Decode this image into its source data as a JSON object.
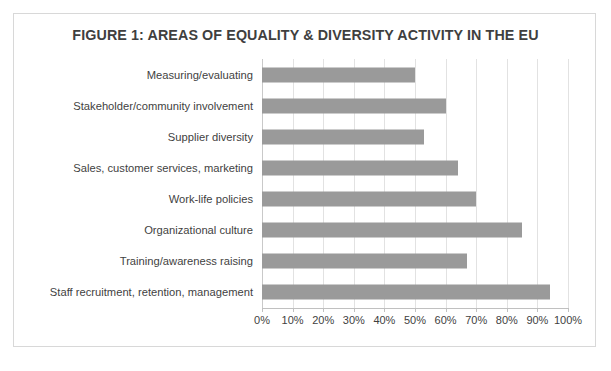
{
  "figure": {
    "title": "FIGURE 1: AREAS OF EQUALITY & DIVERSITY ACTIVITY IN THE EU"
  },
  "chart_data": {
    "type": "bar",
    "orientation": "horizontal",
    "title": "FIGURE 1: AREAS OF EQUALITY & DIVERSITY ACTIVITY IN THE EU",
    "xlabel": "",
    "ylabel": "",
    "xlim": [
      0,
      100
    ],
    "xtick_labels": [
      "0%",
      "10%",
      "20%",
      "30%",
      "40%",
      "50%",
      "60%",
      "70%",
      "80%",
      "90%",
      "100%"
    ],
    "xticks": [
      0,
      10,
      20,
      30,
      40,
      50,
      60,
      70,
      80,
      90,
      100
    ],
    "grid": true,
    "legend": "none",
    "bar_color": "#9a9a9a",
    "categories": [
      "Measuring/evaluating",
      "Stakeholder/community involvement",
      "Supplier diversity",
      "Sales, customer services, marketing",
      "Work-life policies",
      "Organizational culture",
      "Training/awareness raising",
      "Staff recruitment, retention, management"
    ],
    "values": [
      50,
      60,
      53,
      64,
      70,
      85,
      67,
      94
    ]
  }
}
